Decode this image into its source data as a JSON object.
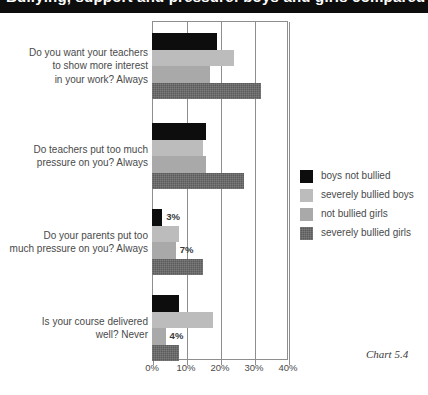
{
  "title_band": {
    "text": "Bullying, support and pressure: boys and girls compared"
  },
  "caption": "Chart 5.4",
  "legend": {
    "items": [
      {
        "label": "boys not bullied",
        "color": "#0d0d0d"
      },
      {
        "label": "severely bullied boys",
        "color": "#bcbcbc"
      },
      {
        "label": "not bullied girls",
        "color": "#a9a9a9"
      },
      {
        "label": "severely bullied girls",
        "color": "#5b5b5b"
      }
    ]
  },
  "chart_data": {
    "type": "bar",
    "orientation": "horizontal",
    "title": "Bullying, support and pressure: boys and girls compared",
    "xlabel": "",
    "ylabel": "",
    "xlim": [
      0,
      40
    ],
    "xticks": [
      0,
      10,
      20,
      30,
      40
    ],
    "xtick_labels": [
      "0%",
      "10%",
      "20%",
      "30%",
      "40%"
    ],
    "grid": true,
    "grid_axis": "x",
    "legend_position": "right",
    "value_suffix": "%",
    "categories": [
      "Do you want your teachers to show more interest in your work? Always",
      "Do teachers put too much pressure on you? Always",
      "Do your parents put too much pressure on you? Always",
      "Is your course delivered well? Never"
    ],
    "category_lines": [
      [
        "Do you want your teachers",
        "to show more interest",
        "in your work? Always"
      ],
      [
        "Do teachers put too much",
        "pressure on you? Always"
      ],
      [
        "Do your parents put too",
        "much pressure on you? Always"
      ],
      [
        "Is your course delivered",
        "well? Never"
      ]
    ],
    "series": [
      {
        "name": "boys not bullied",
        "color": "#0d0d0d",
        "values": [
          19,
          16,
          3,
          8
        ]
      },
      {
        "name": "severely bullied boys",
        "color": "#bcbcbc",
        "values": [
          24,
          15,
          8,
          18
        ]
      },
      {
        "name": "not bullied girls",
        "color": "#a9a9a9",
        "values": [
          17,
          16,
          7,
          4
        ]
      },
      {
        "name": "severely bullied girls",
        "color": "#5b5b5b",
        "values": [
          32,
          27,
          15,
          8
        ]
      }
    ],
    "data_labels": [
      [
        "19%",
        "24%",
        "17%",
        "32%"
      ],
      [
        "16%",
        "15%",
        "16%",
        "27%"
      ],
      [
        "3%",
        "8%",
        "7%",
        "15%"
      ],
      [
        "8%",
        "18%",
        "4%",
        "8%"
      ]
    ]
  }
}
